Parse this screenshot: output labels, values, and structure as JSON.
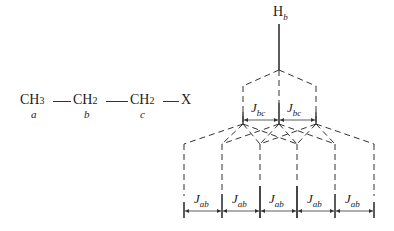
{
  "molecule": {
    "groups": [
      {
        "text": "CH",
        "sub": "3",
        "label": "a"
      },
      {
        "text": "CH",
        "sub": "2",
        "label": "b"
      },
      {
        "text": "CH",
        "sub": "2",
        "label": "c"
      },
      {
        "text": "X",
        "sub": "",
        "label": ""
      }
    ]
  },
  "tree": {
    "proton": {
      "text": "H",
      "sub": "b"
    },
    "level1": {
      "coupling": "J",
      "coupling_sub": "bc",
      "count": 2
    },
    "level2": {
      "coupling": "J",
      "coupling_sub": "ab",
      "count": 5
    }
  }
}
